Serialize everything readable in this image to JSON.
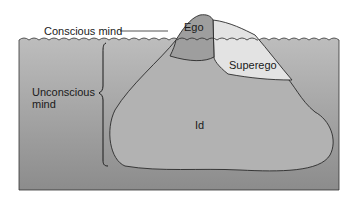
{
  "diagram": {
    "labels": {
      "conscious_mind": "Conscious mind",
      "unconscious_mind_line1": "Unconscious",
      "unconscious_mind_line2": "mind",
      "ego": "Ego",
      "superego": "Superego",
      "id": "Id"
    },
    "colors": {
      "water_top": "#b8b8b8",
      "water_bottom": "#8e8e8e",
      "ego": "#9c9c9c",
      "superego": "#e2e2e2",
      "id": "#b0b0b0",
      "outline": "#2a2a2a",
      "background": "#ffffff"
    }
  }
}
